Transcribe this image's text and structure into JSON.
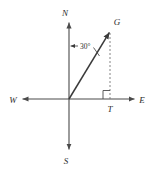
{
  "figure": {
    "background_color": "#ffffff",
    "axis_color": "#4a4a4a",
    "ray_color": "#3a3a3a",
    "dashed_color": "#777777",
    "label_color": "#2b2b2b"
  },
  "labels": {
    "north": "N",
    "south": "S",
    "east": "E",
    "west": "W",
    "point_g": "G",
    "point_t": "T",
    "angle": "30°"
  },
  "geometry": {
    "origin": {
      "x": 69,
      "y": 99
    },
    "north_tip": {
      "x": 69,
      "y": 22
    },
    "south_tip": {
      "x": 69,
      "y": 150
    },
    "east_tip": {
      "x": 135,
      "y": 99
    },
    "west_tip": {
      "x": 22,
      "y": 99
    },
    "point_g": {
      "x": 110,
      "y": 31
    },
    "point_t": {
      "x": 110,
      "y": 99
    },
    "angle_degrees": 30,
    "angle_from": "N",
    "angle_to": "ray OG",
    "right_angle_at": "T"
  }
}
